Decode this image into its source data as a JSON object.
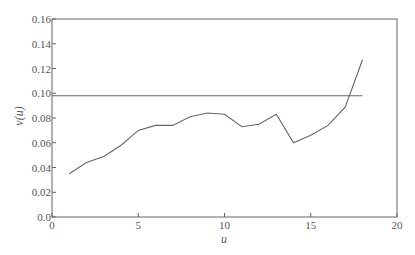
{
  "chart_data": {
    "type": "line",
    "title": "",
    "xlabel": "u",
    "ylabel": "v(u)",
    "xlim": [
      0,
      20
    ],
    "ylim": [
      0,
      0.16
    ],
    "xticks": [
      0,
      5,
      10,
      15,
      20
    ],
    "xtick_labels": [
      "0",
      "5",
      "10",
      "15",
      "20"
    ],
    "yticks": [
      0.0,
      0.02,
      0.04,
      0.06,
      0.08,
      0.1,
      0.12,
      0.14,
      0.16
    ],
    "ytick_labels": [
      "0.0",
      "0.02",
      "0.04",
      "0.06",
      "0.08",
      "0.10",
      "0.12",
      "0.14",
      "0.16"
    ],
    "grid": false,
    "legend": null,
    "series": [
      {
        "name": "v(u)",
        "x": [
          1,
          2,
          3,
          4,
          5,
          6,
          7,
          8,
          9,
          10,
          11,
          12,
          13,
          14,
          15,
          16,
          17,
          18
        ],
        "values": [
          0.035,
          0.044,
          0.049,
          0.058,
          0.07,
          0.074,
          0.074,
          0.081,
          0.084,
          0.083,
          0.073,
          0.075,
          0.083,
          0.06,
          0.066,
          0.074,
          0.089,
          0.127
        ]
      },
      {
        "name": "threshold",
        "x": [
          0,
          18
        ],
        "values": [
          0.098,
          0.098
        ]
      }
    ]
  },
  "colors": {
    "line": "#666666",
    "axis": "#666666",
    "text": "#555555"
  }
}
